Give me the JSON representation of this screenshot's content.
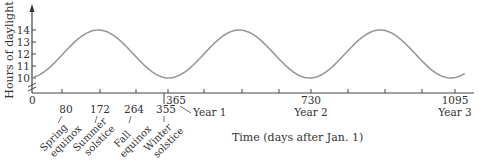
{
  "chart_data": {
    "type": "line",
    "title": "",
    "xlabel": "Time (days after Jan. 1)",
    "ylabel": "Hours of daylight",
    "xlim": [
      0,
      1120
    ],
    "ylim": [
      9,
      15
    ],
    "y_ticks": [
      10,
      11,
      12,
      13,
      14
    ],
    "x_ticks": [
      0,
      91,
      182,
      274,
      365,
      456,
      547,
      639,
      730,
      821,
      912,
      1004,
      1095
    ],
    "x_tick_labels": [
      {
        "value": 0,
        "label": "0"
      },
      {
        "value": 365,
        "label": "365",
        "sublabel": "Year 1"
      },
      {
        "value": 730,
        "label": "730",
        "sublabel": "Year 2"
      },
      {
        "value": 1095,
        "label": "1095",
        "sublabel": "Year 3"
      }
    ],
    "annotations": [
      {
        "day": 80,
        "label": "80",
        "text": "Spring equinox"
      },
      {
        "day": 172,
        "label": "172",
        "text": "Summer solstice"
      },
      {
        "day": 264,
        "label": "264",
        "text": "Fall equinox"
      },
      {
        "day": 355,
        "label": "355",
        "text": "Winter solstice"
      }
    ],
    "series": [
      {
        "name": "Hours of daylight",
        "function": "12 + 2*sin(2*pi*(t-80)/365)",
        "x": [
          0,
          40,
          80,
          126,
          172,
          218,
          264,
          310,
          355,
          400,
          445,
          491,
          537,
          583,
          629,
          675,
          720,
          765,
          810,
          856,
          902,
          948,
          994,
          1040,
          1085,
          1120
        ],
        "values": [
          10.0,
          10.6,
          12.0,
          13.4,
          14.0,
          13.4,
          12.0,
          10.6,
          10.0,
          10.6,
          12.0,
          13.4,
          14.0,
          13.4,
          12.0,
          10.6,
          10.0,
          10.6,
          12.0,
          13.4,
          14.0,
          13.4,
          12.0,
          10.6,
          10.0,
          10.4
        ]
      }
    ],
    "grid": false,
    "legend": null,
    "axis_break": true
  },
  "labels": {
    "ylabel": "Hours of daylight",
    "xlabel": "Time (days after Jan. 1)",
    "y10": "10",
    "y11": "11",
    "y12": "12",
    "y13": "13",
    "y14": "14",
    "x0": "0",
    "x365": "365",
    "x730": "730",
    "x1095": "1095",
    "year1": "Year 1",
    "year2": "Year 2",
    "year3": "Year 3",
    "d80": "80",
    "d172": "172",
    "d264": "264",
    "d355": "355",
    "spring1": "Spring",
    "spring2": "equinox",
    "summer1": "Summer",
    "summer2": "solstice",
    "fall1": "Fall",
    "fall2": "equinox",
    "winter1": "Winter",
    "winter2": "solstice"
  }
}
